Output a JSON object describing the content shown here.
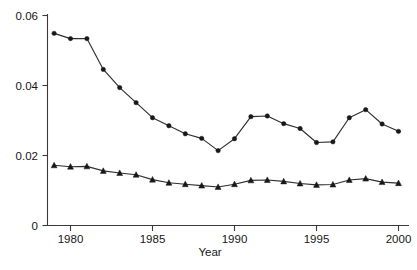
{
  "chart_data": {
    "type": "line",
    "title": "",
    "subtitle": "",
    "xlabel": "Year",
    "ylabel": "",
    "grid": false,
    "legend": "none",
    "xlim": [
      1978.6,
      2000.6
    ],
    "ylim": [
      0,
      0.063
    ],
    "x": [
      1979,
      1980,
      1981,
      1982,
      1983,
      1984,
      1985,
      1986,
      1987,
      1988,
      1989,
      1990,
      1991,
      1992,
      1993,
      1994,
      1995,
      1996,
      1997,
      1998,
      1999,
      2000
    ],
    "xticks": [
      1980,
      1985,
      1990,
      1995,
      2000
    ],
    "xticklabels": [
      "1980",
      "1985",
      "1990",
      "1995",
      "2000"
    ],
    "yticks": [
      0,
      0.02,
      0.04,
      0.06
    ],
    "yticklabels": [
      "0",
      "0.02",
      "0.04",
      "0.06"
    ],
    "series": [
      {
        "name": "upper-series",
        "marker": "circle",
        "values": [
          0.0549,
          0.0534,
          0.0534,
          0.0446,
          0.0394,
          0.0351,
          0.0308,
          0.0285,
          0.0262,
          0.0249,
          0.0214,
          0.0248,
          0.0311,
          0.0313,
          0.0291,
          0.0277,
          0.0237,
          0.0239,
          0.0308,
          0.0331,
          0.029,
          0.0269
        ]
      },
      {
        "name": "lower-series",
        "marker": "triangle",
        "values": [
          0.0172,
          0.0168,
          0.0169,
          0.0156,
          0.015,
          0.0145,
          0.0131,
          0.0122,
          0.0118,
          0.0114,
          0.011,
          0.0118,
          0.0129,
          0.013,
          0.0126,
          0.012,
          0.0116,
          0.0117,
          0.013,
          0.0134,
          0.0124,
          0.0121
        ]
      }
    ]
  },
  "axes": {
    "y_tick_0": "0",
    "y_tick_1": "0.02",
    "y_tick_2": "0.04",
    "y_tick_3": "0.06",
    "x_tick_0": "1980",
    "x_tick_1": "1985",
    "x_tick_2": "1990",
    "x_tick_3": "1995",
    "x_tick_4": "2000",
    "x_axis_title": "Year"
  },
  "colors": {
    "line": "#303030",
    "marker": "#181818",
    "axis": "#3a3a3a",
    "text": "#161616",
    "background": "#ffffff"
  }
}
